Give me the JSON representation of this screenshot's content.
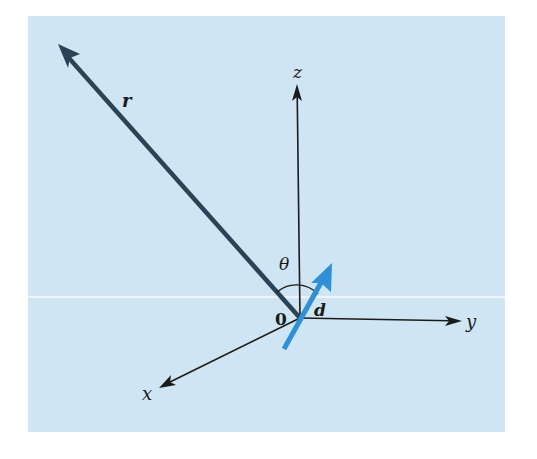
{
  "diagram": {
    "title": "",
    "colors": {
      "background_panel": "#cfe5f3",
      "axis": "#1b1b1b",
      "vector_r": "#2b4356",
      "vector_d": "#2f8fd8"
    },
    "labels": {
      "z_axis": "z",
      "y_axis": "y",
      "x_axis": "x",
      "origin": "0",
      "vector_r": "r",
      "vector_d": "d",
      "angle": "θ"
    },
    "elements": [
      {
        "id": "z-axis",
        "type": "arrow",
        "from": [
          300,
          318
        ],
        "to": [
          297,
          85
        ]
      },
      {
        "id": "y-axis",
        "type": "arrow",
        "from": [
          300,
          318
        ],
        "to": [
          460,
          321
        ]
      },
      {
        "id": "x-axis",
        "type": "arrow",
        "from": [
          300,
          318
        ],
        "to": [
          160,
          387
        ]
      },
      {
        "id": "r-vector",
        "type": "thick-arrow",
        "from": [
          300,
          318
        ],
        "to": [
          58,
          44
        ]
      },
      {
        "id": "d-dipole",
        "type": "thick-arrow",
        "from": [
          283,
          349
        ],
        "to": [
          332,
          264
        ]
      },
      {
        "id": "theta-arc",
        "type": "arc",
        "between": [
          "r-vector",
          "d-dipole"
        ]
      }
    ]
  }
}
